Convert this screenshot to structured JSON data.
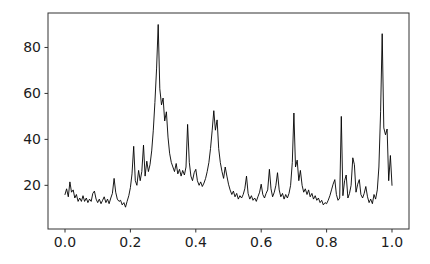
{
  "chart_data": {
    "type": "line",
    "title": "",
    "xlabel": "",
    "ylabel": "",
    "xlim": [
      -0.052,
      1.052
    ],
    "ylim": [
      1,
      95
    ],
    "xticks": [
      0.0,
      0.2,
      0.4,
      0.6,
      0.8,
      1.0
    ],
    "xtick_labels": [
      "0.0",
      "0.2",
      "0.4",
      "0.6",
      "0.8",
      "1.0"
    ],
    "yticks": [
      20,
      40,
      60,
      80
    ],
    "ytick_labels": [
      "20",
      "40",
      "60",
      "80"
    ],
    "grid": false,
    "legend": null,
    "line_color": "#000000",
    "line_width": 0.9,
    "spine_color": "#333333",
    "tick_color": "#333333",
    "tick_label_color": "#1c1c1c",
    "background_color": "#ffffff",
    "series_name": "noisy-signal",
    "x": [
      0.0,
      0.005,
      0.01,
      0.015,
      0.02,
      0.025,
      0.03,
      0.035,
      0.04,
      0.045,
      0.05,
      0.055,
      0.06,
      0.065,
      0.07,
      0.075,
      0.08,
      0.085,
      0.09,
      0.095,
      0.1,
      0.105,
      0.11,
      0.115,
      0.12,
      0.125,
      0.13,
      0.135,
      0.14,
      0.145,
      0.15,
      0.155,
      0.16,
      0.165,
      0.17,
      0.175,
      0.18,
      0.185,
      0.19,
      0.195,
      0.2,
      0.205,
      0.21,
      0.215,
      0.22,
      0.225,
      0.23,
      0.235,
      0.24,
      0.245,
      0.25,
      0.255,
      0.26,
      0.265,
      0.27,
      0.275,
      0.28,
      0.285,
      0.29,
      0.295,
      0.3,
      0.305,
      0.31,
      0.315,
      0.32,
      0.325,
      0.33,
      0.335,
      0.34,
      0.345,
      0.35,
      0.355,
      0.36,
      0.365,
      0.37,
      0.375,
      0.38,
      0.385,
      0.39,
      0.395,
      0.4,
      0.405,
      0.41,
      0.415,
      0.42,
      0.425,
      0.43,
      0.435,
      0.44,
      0.445,
      0.45,
      0.455,
      0.46,
      0.465,
      0.47,
      0.475,
      0.48,
      0.485,
      0.49,
      0.495,
      0.5,
      0.505,
      0.51,
      0.515,
      0.52,
      0.525,
      0.53,
      0.535,
      0.54,
      0.545,
      0.55,
      0.555,
      0.56,
      0.565,
      0.57,
      0.575,
      0.58,
      0.585,
      0.59,
      0.595,
      0.6,
      0.605,
      0.61,
      0.615,
      0.62,
      0.625,
      0.63,
      0.635,
      0.64,
      0.645,
      0.65,
      0.655,
      0.66,
      0.665,
      0.67,
      0.675,
      0.68,
      0.685,
      0.69,
      0.695,
      0.7,
      0.705,
      0.71,
      0.715,
      0.72,
      0.725,
      0.73,
      0.735,
      0.74,
      0.745,
      0.75,
      0.755,
      0.76,
      0.765,
      0.77,
      0.775,
      0.78,
      0.785,
      0.79,
      0.795,
      0.8,
      0.805,
      0.81,
      0.815,
      0.82,
      0.825,
      0.83,
      0.835,
      0.84,
      0.845,
      0.85,
      0.855,
      0.86,
      0.865,
      0.87,
      0.875,
      0.88,
      0.885,
      0.89,
      0.895,
      0.9,
      0.905,
      0.91,
      0.915,
      0.92,
      0.925,
      0.93,
      0.935,
      0.94,
      0.945,
      0.95,
      0.955,
      0.96,
      0.965,
      0.97,
      0.975,
      0.98,
      0.985,
      0.99,
      0.995,
      1.0
    ],
    "y": [
      16,
      18.5,
      15,
      21.5,
      17,
      18,
      14.5,
      16,
      13,
      14.5,
      13,
      15.5,
      13,
      14.5,
      12.5,
      14,
      13,
      16.5,
      17.5,
      14,
      12.5,
      14,
      12,
      13.5,
      15,
      12.5,
      14,
      12,
      14.5,
      16.5,
      23,
      17,
      14,
      13,
      13.5,
      11.5,
      12.5,
      10.5,
      13,
      15.5,
      19,
      25,
      37,
      22,
      20,
      26.5,
      22,
      26,
      37.5,
      24,
      30.5,
      26,
      29,
      35,
      44,
      56,
      71,
      90,
      62,
      55,
      58,
      48,
      52,
      41,
      34,
      30,
      28,
      26,
      29.5,
      25,
      27,
      24,
      26.5,
      24.5,
      28,
      46.5,
      30,
      24,
      22,
      25.5,
      27,
      22,
      20,
      21.5,
      19.5,
      21,
      23,
      26,
      30,
      36,
      44,
      52.5,
      44,
      48.5,
      36,
      30,
      26,
      23,
      28,
      24,
      20.5,
      18,
      16,
      17.5,
      15,
      16.5,
      14,
      15.5,
      14.5,
      16,
      18.5,
      24,
      16.5,
      14,
      15.5,
      13.5,
      14.5,
      13,
      15,
      17,
      20.5,
      16,
      14.5,
      16.5,
      18,
      27,
      18.5,
      15,
      17,
      20,
      25.5,
      18,
      15,
      16.5,
      14,
      16,
      14.5,
      16.5,
      20,
      30,
      51.5,
      28,
      31,
      22,
      26.5,
      20,
      17,
      18.5,
      16,
      18,
      15,
      16.5,
      14,
      15.5,
      13.5,
      14.5,
      12.5,
      13.5,
      11.5,
      12.5,
      12,
      13.5,
      15.5,
      18,
      20.5,
      22.5,
      16,
      13.5,
      14.5,
      50,
      15.5,
      22,
      24.5,
      14.5,
      16.5,
      20,
      32,
      29,
      17,
      20.5,
      22.5,
      16,
      14.5,
      16.5,
      19.5,
      15,
      12.5,
      14,
      12,
      16,
      14,
      18,
      28,
      52,
      86,
      45,
      42,
      44.5,
      22,
      33,
      20
    ]
  }
}
